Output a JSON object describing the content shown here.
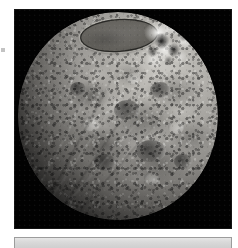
{
  "page": {
    "background_color": "#ffffff",
    "width": 238,
    "height": 248
  },
  "margin_mark": {
    "name": "registration-mark",
    "color": "#b9b9b9"
  },
  "photo": {
    "name": "astronomical-photograph",
    "caption": "",
    "frame_color": "#020202",
    "subject": "planetary body",
    "description": "Grayscale telescopic image of an icy planetary body lit from the upper right, with a large dark elliptical polar basin near the top and bright frosted terrain beside it.",
    "features": [
      {
        "name": "polar-basin",
        "label": "dark elliptical polar basin",
        "tone": "#66645f"
      },
      {
        "name": "ice-field",
        "label": "bright frosted polar terrain",
        "tone": "#fcfcfa"
      },
      {
        "name": "maria",
        "label": "dark mare provinces",
        "tone": "#4c4b49"
      },
      {
        "name": "highlands",
        "label": "bright highland patches",
        "tone": "#c9c7c2"
      },
      {
        "name": "lineaments",
        "label": "grooved ridge lineaments",
        "tone": "#e1e1de"
      },
      {
        "name": "terminator",
        "label": "shadowed limb / terminator",
        "tone": "#060606"
      }
    ]
  },
  "lower_panel": {
    "name": "lower-panel",
    "faint_text": "",
    "background_color": "#d9d9d9",
    "border_color": "#9c9c9c"
  }
}
